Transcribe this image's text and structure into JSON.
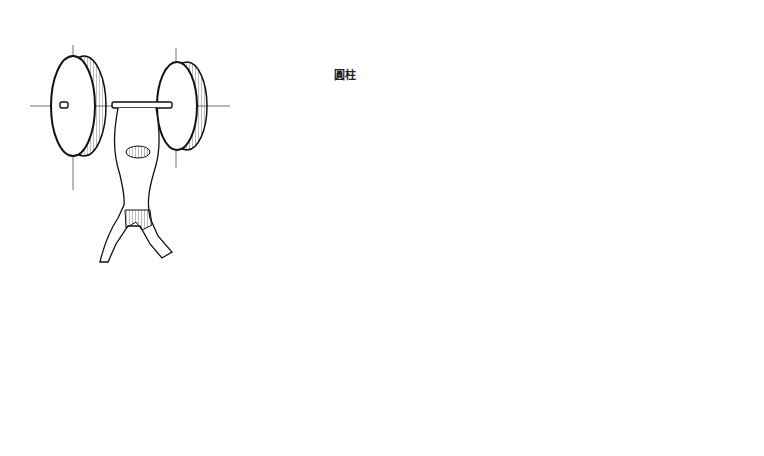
{
  "figure": {
    "label": "圓柱",
    "label_meaning": "cylinder",
    "panels": [
      {
        "name": "weightlifter-barbell",
        "description": "figure lifting barbell with two disc weights"
      },
      {
        "name": "dumbbell-axis-ellipses",
        "description": "two ellipses joined by an axle with construction lines"
      },
      {
        "name": "cylinder-pair-construction",
        "description": "two hatched cylinders on shared axle with construction lines"
      },
      {
        "name": "stacked-ellipses-column",
        "description": "five ellipses on vertical threaded rod inside tapering column"
      },
      {
        "name": "wheel-axle",
        "description": "pair of spoked wheels on an axle"
      },
      {
        "name": "ellipse-with-rod",
        "description": "tilted ellipse pierced by a rod with tangent construction lines"
      }
    ]
  }
}
